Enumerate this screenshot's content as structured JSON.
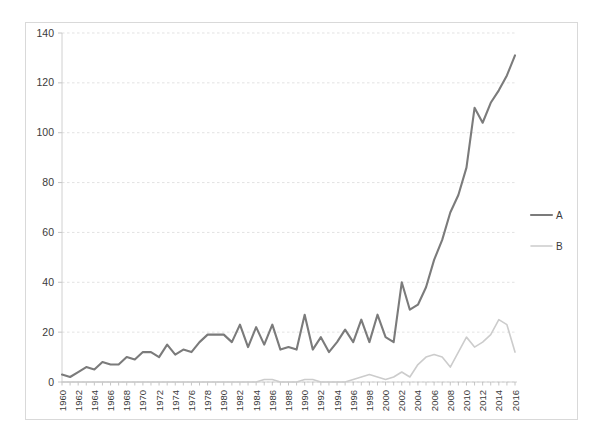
{
  "chart_data": {
    "type": "line",
    "title": "",
    "subtitle": "",
    "xlabel": "",
    "ylabel": "",
    "ylim": [
      0,
      140
    ],
    "xlim": [
      1960,
      2016
    ],
    "grid": true,
    "legend_position": "right",
    "y_ticks": [
      0,
      20,
      40,
      60,
      80,
      100,
      120,
      140
    ],
    "x_tick_labels": [
      "1960",
      "1962",
      "1964",
      "1966",
      "1968",
      "1970",
      "1972",
      "1974",
      "1976",
      "1978",
      "1980",
      "1982",
      "1984",
      "1986",
      "1988",
      "1990",
      "1992",
      "1994",
      "1996",
      "1998",
      "2000",
      "2002",
      "2004",
      "2006",
      "2008",
      "2010",
      "2012",
      "2014",
      "2016"
    ],
    "x": [
      1960,
      1961,
      1962,
      1963,
      1964,
      1965,
      1966,
      1967,
      1968,
      1969,
      1970,
      1971,
      1972,
      1973,
      1974,
      1975,
      1976,
      1977,
      1978,
      1979,
      1980,
      1981,
      1982,
      1983,
      1984,
      1985,
      1986,
      1987,
      1988,
      1989,
      1990,
      1991,
      1992,
      1993,
      1994,
      1995,
      1996,
      1997,
      1998,
      1999,
      2000,
      2001,
      2002,
      2003,
      2004,
      2005,
      2006,
      2007,
      2008,
      2009,
      2010,
      2011,
      2012,
      2013,
      2014,
      2015,
      2016
    ],
    "series": [
      {
        "name": "A",
        "color": "#7b7b7b",
        "values": [
          3,
          2,
          4,
          6,
          5,
          8,
          7,
          7,
          10,
          9,
          12,
          12,
          10,
          15,
          11,
          13,
          12,
          16,
          19,
          19,
          19,
          16,
          23,
          14,
          22,
          15,
          23,
          13,
          14,
          13,
          27,
          13,
          18,
          12,
          16,
          21,
          16,
          25,
          16,
          27,
          18,
          16,
          40,
          29,
          31,
          38,
          49,
          57,
          68,
          75,
          86,
          110,
          104,
          112,
          117,
          123,
          131
        ]
      },
      {
        "name": "B",
        "color": "#cccccc",
        "values": [
          0,
          0,
          0,
          0,
          0,
          0,
          0,
          0,
          0,
          0,
          0,
          0,
          0,
          0,
          0,
          0,
          0,
          0,
          0,
          0,
          0,
          0,
          0,
          0,
          0,
          1,
          1,
          0,
          0,
          0,
          1,
          1,
          0,
          0,
          0,
          0,
          1,
          2,
          3,
          2,
          1,
          2,
          4,
          2,
          7,
          10,
          11,
          10,
          6,
          12,
          18,
          14,
          16,
          19,
          25,
          23,
          12
        ]
      }
    ],
    "legend": [
      {
        "label": "A",
        "color": "#7b7b7b"
      },
      {
        "label": "B",
        "color": "#cccccc"
      }
    ]
  }
}
